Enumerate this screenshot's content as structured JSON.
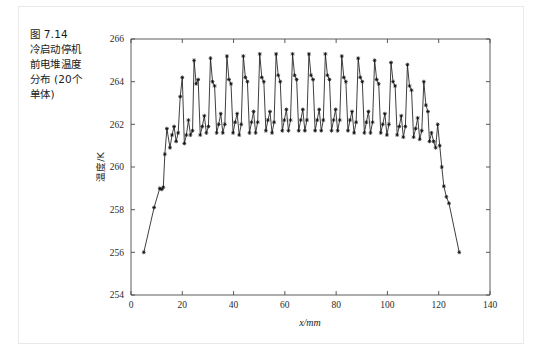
{
  "figure": {
    "caption_lines": [
      "图 7.14",
      "冷启动停机",
      "前电堆温度",
      "分布 (20个",
      "单体)"
    ],
    "caption_full": "图 7.14 冷启动停机前电堆温度分布 (20个单体)",
    "border_color": "#e9e9e9",
    "background": "#ffffff"
  },
  "chart_data": {
    "type": "line",
    "title": "",
    "subtitle": "",
    "xlabel": "x/mm",
    "ylabel": "温度/K",
    "xlim": [
      0,
      140
    ],
    "ylim": [
      254,
      266
    ],
    "xticks": [
      0,
      20,
      40,
      60,
      80,
      100,
      120,
      140
    ],
    "xticklabels": [
      "0",
      "20",
      "40",
      "60",
      "80",
      "100",
      "120",
      "140"
    ],
    "yticks": [
      254,
      256,
      258,
      260,
      262,
      264,
      266
    ],
    "yticklabels": [
      "254",
      "256",
      "258",
      "260",
      "262",
      "264",
      "266"
    ],
    "grid": false,
    "legend": null,
    "legend_position": "none",
    "line_color": "#1c1c1c",
    "marker": "star",
    "marker_color": "#111111",
    "series": [
      {
        "name": "电堆温度分布",
        "x": [
          5.0,
          9.0,
          11.2,
          12.0,
          12.6,
          13.2,
          14.0,
          15.2,
          16.0,
          16.8,
          17.6,
          18.4,
          19.2,
          20.0,
          20.8,
          21.6,
          22.4,
          23.2,
          24.0,
          24.6,
          25.4,
          26.2,
          27.0,
          27.8,
          28.6,
          29.4,
          30.2,
          31.0,
          31.8,
          32.6,
          33.4,
          34.2,
          35.0,
          35.8,
          36.6,
          37.4,
          38.2,
          39.0,
          39.8,
          40.6,
          41.4,
          42.2,
          43.0,
          43.8,
          44.6,
          45.4,
          46.2,
          47.0,
          47.8,
          48.6,
          49.4,
          50.2,
          51.0,
          51.8,
          52.6,
          53.4,
          54.2,
          55.0,
          55.8,
          56.6,
          57.4,
          58.2,
          59.0,
          59.8,
          60.6,
          61.4,
          62.2,
          63.0,
          63.8,
          64.6,
          65.4,
          66.2,
          67.0,
          67.8,
          68.6,
          69.4,
          70.2,
          71.0,
          71.8,
          72.6,
          73.4,
          74.2,
          75.0,
          75.8,
          76.6,
          77.4,
          78.2,
          79.0,
          79.8,
          80.6,
          81.4,
          82.2,
          83.0,
          83.8,
          84.6,
          85.4,
          86.2,
          87.0,
          87.8,
          88.6,
          89.4,
          90.2,
          91.0,
          91.8,
          92.6,
          93.4,
          94.2,
          95.0,
          95.8,
          96.6,
          97.4,
          98.2,
          99.0,
          99.8,
          100.6,
          101.4,
          102.2,
          103.0,
          103.8,
          104.6,
          105.4,
          106.2,
          107.0,
          107.8,
          108.6,
          109.4,
          110.2,
          111.0,
          111.8,
          112.6,
          113.4,
          114.2,
          115.0,
          115.8,
          116.4,
          117.2,
          118.0,
          118.8,
          119.6,
          120.4,
          121.2,
          122.0,
          123.0,
          124.0,
          128.0
        ],
        "y": [
          256.0,
          258.1,
          259.0,
          258.95,
          259.05,
          260.6,
          261.8,
          260.9,
          261.5,
          261.9,
          261.2,
          261.6,
          263.3,
          264.2,
          261.1,
          261.5,
          262.2,
          261.5,
          261.7,
          265.0,
          263.9,
          264.1,
          261.5,
          261.9,
          262.4,
          261.6,
          261.9,
          265.1,
          264.0,
          263.8,
          261.6,
          262.0,
          262.5,
          261.6,
          262.0,
          265.2,
          264.1,
          263.9,
          261.6,
          262.1,
          262.5,
          261.5,
          262.0,
          265.2,
          264.2,
          264.0,
          261.6,
          262.1,
          262.6,
          261.6,
          262.1,
          265.3,
          264.2,
          264.0,
          261.7,
          262.2,
          262.6,
          261.6,
          262.1,
          265.3,
          264.3,
          264.0,
          261.7,
          262.2,
          262.7,
          261.7,
          262.2,
          265.3,
          264.3,
          264.1,
          261.7,
          262.2,
          262.7,
          261.7,
          262.2,
          265.3,
          264.3,
          264.1,
          261.7,
          262.2,
          262.7,
          261.7,
          262.2,
          265.3,
          264.3,
          264.1,
          261.7,
          262.2,
          262.7,
          261.7,
          262.2,
          265.2,
          264.2,
          264.0,
          261.7,
          262.2,
          262.6,
          261.6,
          262.1,
          265.1,
          264.2,
          264.0,
          261.6,
          262.1,
          262.6,
          261.6,
          262.1,
          265.0,
          264.1,
          263.9,
          261.6,
          262.0,
          262.5,
          261.5,
          262.0,
          264.9,
          264.0,
          263.8,
          261.5,
          261.9,
          262.4,
          261.4,
          261.9,
          264.8,
          263.8,
          263.6,
          261.4,
          261.8,
          262.3,
          261.3,
          261.7,
          264.0,
          262.9,
          262.6,
          261.2,
          261.6,
          261.2,
          260.9,
          262.0,
          261.0,
          260.0,
          259.1,
          258.6,
          258.3,
          256.0
        ]
      }
    ]
  }
}
